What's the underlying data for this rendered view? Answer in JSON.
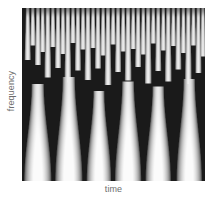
{
  "figure": {
    "title": "",
    "background_color": "#ffffff",
    "plot_area": {
      "x": 22,
      "y": 8,
      "width": 183,
      "height": 173
    }
  },
  "axes": {
    "y_label": "frequency",
    "x_label": "time",
    "label_color": "#6d6d6d",
    "tick_labels_visible": false
  },
  "chart_data": {
    "type": "heatmap",
    "title": "",
    "subtitle": "",
    "xlabel": "time",
    "ylabel": "frequency",
    "legend": [],
    "grid": false,
    "colormap": {
      "name": "grayscale",
      "low_color": "#1a1a1a",
      "mid_color": "#8c8c8c",
      "high_color": "#fbfbfb"
    },
    "xlim": [
      0,
      1
    ],
    "ylim": [
      0,
      1
    ],
    "structure": {
      "orientation": "frequency increases upward; branches split upward / merge downward",
      "top_branch_count": 38,
      "bottom_trunk_count": 6,
      "merge_levels": 3
    },
    "trunks": [
      {
        "x": 0.085,
        "width": 0.15,
        "top": 0.56,
        "peak_brightness": 0.97
      },
      {
        "x": 0.255,
        "width": 0.15,
        "top": 0.52,
        "peak_brightness": 0.99
      },
      {
        "x": 0.42,
        "width": 0.135,
        "top": 0.6,
        "peak_brightness": 0.96
      },
      {
        "x": 0.58,
        "width": 0.145,
        "top": 0.545,
        "peak_brightness": 0.98
      },
      {
        "x": 0.745,
        "width": 0.14,
        "top": 0.575,
        "peak_brightness": 0.97
      },
      {
        "x": 0.915,
        "width": 0.14,
        "top": 0.53,
        "peak_brightness": 0.96
      }
    ],
    "branches": [
      {
        "x": 0.03,
        "top": 0.01,
        "bottom": 0.3,
        "width": 0.022
      },
      {
        "x": 0.058,
        "top": 0.01,
        "bottom": 0.215,
        "width": 0.02
      },
      {
        "x": 0.086,
        "top": 0.01,
        "bottom": 0.33,
        "width": 0.022
      },
      {
        "x": 0.112,
        "top": 0.01,
        "bottom": 0.255,
        "width": 0.02
      },
      {
        "x": 0.14,
        "top": 0.01,
        "bottom": 0.4,
        "width": 0.024
      },
      {
        "x": 0.168,
        "top": 0.01,
        "bottom": 0.225,
        "width": 0.02
      },
      {
        "x": 0.196,
        "top": 0.01,
        "bottom": 0.345,
        "width": 0.022
      },
      {
        "x": 0.223,
        "top": 0.01,
        "bottom": 0.265,
        "width": 0.02
      },
      {
        "x": 0.25,
        "top": 0.01,
        "bottom": 0.43,
        "width": 0.024
      },
      {
        "x": 0.278,
        "top": 0.01,
        "bottom": 0.2,
        "width": 0.02
      },
      {
        "x": 0.305,
        "top": 0.01,
        "bottom": 0.36,
        "width": 0.022
      },
      {
        "x": 0.333,
        "top": 0.01,
        "bottom": 0.24,
        "width": 0.02
      },
      {
        "x": 0.36,
        "top": 0.01,
        "bottom": 0.415,
        "width": 0.024
      },
      {
        "x": 0.388,
        "top": 0.01,
        "bottom": 0.23,
        "width": 0.02
      },
      {
        "x": 0.415,
        "top": 0.01,
        "bottom": 0.35,
        "width": 0.022
      },
      {
        "x": 0.443,
        "top": 0.01,
        "bottom": 0.275,
        "width": 0.02
      },
      {
        "x": 0.47,
        "top": 0.01,
        "bottom": 0.445,
        "width": 0.024
      },
      {
        "x": 0.498,
        "top": 0.01,
        "bottom": 0.21,
        "width": 0.02
      },
      {
        "x": 0.525,
        "top": 0.01,
        "bottom": 0.37,
        "width": 0.022
      },
      {
        "x": 0.553,
        "top": 0.01,
        "bottom": 0.25,
        "width": 0.02
      },
      {
        "x": 0.58,
        "top": 0.01,
        "bottom": 0.42,
        "width": 0.024
      },
      {
        "x": 0.608,
        "top": 0.01,
        "bottom": 0.235,
        "width": 0.02
      },
      {
        "x": 0.635,
        "top": 0.01,
        "bottom": 0.34,
        "width": 0.022
      },
      {
        "x": 0.663,
        "top": 0.01,
        "bottom": 0.268,
        "width": 0.02
      },
      {
        "x": 0.69,
        "top": 0.01,
        "bottom": 0.435,
        "width": 0.024
      },
      {
        "x": 0.718,
        "top": 0.01,
        "bottom": 0.205,
        "width": 0.02
      },
      {
        "x": 0.745,
        "top": 0.01,
        "bottom": 0.365,
        "width": 0.022
      },
      {
        "x": 0.773,
        "top": 0.01,
        "bottom": 0.245,
        "width": 0.02
      },
      {
        "x": 0.8,
        "top": 0.01,
        "bottom": 0.425,
        "width": 0.024
      },
      {
        "x": 0.828,
        "top": 0.01,
        "bottom": 0.22,
        "width": 0.02
      },
      {
        "x": 0.855,
        "top": 0.01,
        "bottom": 0.355,
        "width": 0.022
      },
      {
        "x": 0.883,
        "top": 0.01,
        "bottom": 0.26,
        "width": 0.02
      },
      {
        "x": 0.91,
        "top": 0.01,
        "bottom": 0.44,
        "width": 0.024
      },
      {
        "x": 0.938,
        "top": 0.01,
        "bottom": 0.215,
        "width": 0.02
      },
      {
        "x": 0.965,
        "top": 0.01,
        "bottom": 0.375,
        "width": 0.022
      },
      {
        "x": 0.99,
        "top": 0.01,
        "bottom": 0.28,
        "width": 0.02
      }
    ]
  }
}
